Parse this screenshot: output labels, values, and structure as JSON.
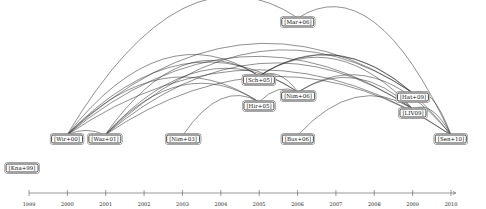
{
  "diagram": {
    "type": "citation-timeline-arc-diagram",
    "axis": {
      "years": [
        "1999",
        "2000",
        "2001",
        "2002",
        "2003",
        "2004",
        "2005",
        "2006",
        "2007",
        "2008",
        "2009",
        "2010"
      ],
      "y": 193,
      "x_start": 29,
      "x_end": 451
    },
    "nodes": [
      {
        "id": "Kna99",
        "label": "[Kna+99]",
        "x": 22,
        "y": 168
      },
      {
        "id": "Wir00",
        "label": "[Wir+00]",
        "x": 67,
        "y": 139
      },
      {
        "id": "Waz01",
        "label": "[Waz+01]",
        "x": 105,
        "y": 139
      },
      {
        "id": "Nim03",
        "label": "[Nim+03]",
        "x": 183,
        "y": 139
      },
      {
        "id": "Sch05",
        "label": "[Sch+05]",
        "x": 259,
        "y": 80
      },
      {
        "id": "Hir05",
        "label": "[Hir+05]",
        "x": 259,
        "y": 106
      },
      {
        "id": "Mar06",
        "label": "[Mar+06]",
        "x": 298,
        "y": 22
      },
      {
        "id": "Nim06",
        "label": "[Nim+06]",
        "x": 298,
        "y": 96
      },
      {
        "id": "Bus06",
        "label": "[Bus+06]",
        "x": 298,
        "y": 139
      },
      {
        "id": "Hat09",
        "label": "[Hat+09]",
        "x": 413,
        "y": 97
      },
      {
        "id": "LIV09",
        "label": "[LIV09]",
        "x": 413,
        "y": 113
      },
      {
        "id": "Sen10",
        "label": "[Sen+10]",
        "x": 451,
        "y": 139
      }
    ],
    "edges": [
      [
        "Wir00",
        "Mar06"
      ],
      [
        "Mar06",
        "Sen10"
      ],
      [
        "Wir00",
        "Sch05"
      ],
      [
        "Wir00",
        "Hir05"
      ],
      [
        "Wir00",
        "Nim06"
      ],
      [
        "Wir00",
        "Hat09"
      ],
      [
        "Wir00",
        "LIV09"
      ],
      [
        "Wir00",
        "Sen10"
      ],
      [
        "Wir00",
        "Waz01"
      ],
      [
        "Waz01",
        "Sch05"
      ],
      [
        "Waz01",
        "Hir05"
      ],
      [
        "Waz01",
        "Nim06"
      ],
      [
        "Waz01",
        "Hat09"
      ],
      [
        "Waz01",
        "LIV09"
      ],
      [
        "Waz01",
        "Sen10"
      ],
      [
        "Nim03",
        "Hir05"
      ],
      [
        "Sch05",
        "Hat09"
      ],
      [
        "Sch05",
        "LIV09"
      ],
      [
        "Sch05",
        "Sen10"
      ],
      [
        "Sch05",
        "Nim06"
      ],
      [
        "Hir05",
        "Nim06"
      ],
      [
        "Nim06",
        "Sen10"
      ],
      [
        "Nim06",
        "LIV09"
      ],
      [
        "Bus06",
        "LIV09"
      ],
      [
        "Hat09",
        "Sen10"
      ],
      [
        "LIV09",
        "Sen10"
      ]
    ]
  }
}
